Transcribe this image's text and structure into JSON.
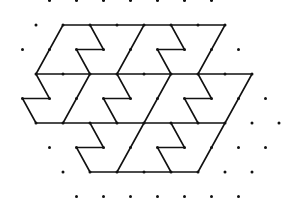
{
  "figure": {
    "line_color": "#111111",
    "dot_color": "#111111",
    "background": "#ffffff",
    "dot_radius": 1.5,
    "lattice": {
      "dx": 27,
      "dy": 24.6,
      "x0": 22.5,
      "y0": 0.5
    },
    "rows": [
      {
        "y": 0.5,
        "xs": [
          49.5,
          76.5,
          103.5,
          130.5,
          157.5,
          184.5,
          211.5
        ]
      },
      {
        "y": 25,
        "xs": [
          36,
          63,
          90,
          117,
          144,
          171,
          198,
          225
        ]
      },
      {
        "y": 49.5,
        "xs": [
          22.5,
          49.5,
          76.5,
          103.5,
          130.5,
          157.5,
          184.5,
          211.5,
          238.5
        ]
      },
      {
        "y": 74,
        "xs": [
          36,
          63,
          90,
          117,
          144,
          171,
          198,
          225,
          252
        ]
      },
      {
        "y": 98.5,
        "xs": [
          22.5,
          49.5,
          76.5,
          103.5,
          130.5,
          157.5,
          184.5,
          211.5,
          238.5,
          265.5
        ]
      },
      {
        "y": 123,
        "xs": [
          36,
          63,
          90,
          117,
          144,
          171,
          198,
          225,
          252,
          279
        ]
      },
      {
        "y": 147.5,
        "xs": [
          49.5,
          76.5,
          103.5,
          130.5,
          157.5,
          184.5,
          211.5,
          238.5,
          265.5
        ]
      },
      {
        "y": 172,
        "xs": [
          63,
          90,
          117,
          144,
          171,
          198,
          225,
          252
        ]
      },
      {
        "y": 196.5,
        "xs": [
          76.5,
          103.5,
          130.5,
          157.5,
          184.5,
          211.5,
          238.5
        ]
      }
    ],
    "polylines": [
      [
        [
          63,
          25
        ],
        [
          225,
          25
        ]
      ],
      [
        [
          63,
          25
        ],
        [
          36,
          74
        ]
      ],
      [
        [
          90,
          25
        ],
        [
          103.5,
          49.5
        ],
        [
          76.5,
          49.5
        ],
        [
          90,
          74
        ]
      ],
      [
        [
          144,
          25
        ],
        [
          117,
          74
        ]
      ],
      [
        [
          171,
          25
        ],
        [
          184.5,
          49.5
        ],
        [
          157.5,
          49.5
        ],
        [
          171,
          74
        ]
      ],
      [
        [
          225,
          25
        ],
        [
          198,
          74
        ]
      ],
      [
        [
          36,
          74
        ],
        [
          252,
          74
        ]
      ],
      [
        [
          36,
          74
        ],
        [
          49.5,
          98.5
        ],
        [
          22.5,
          98.5
        ],
        [
          36,
          123
        ]
      ],
      [
        [
          90,
          74
        ],
        [
          63,
          123
        ]
      ],
      [
        [
          117,
          74
        ],
        [
          130.5,
          98.5
        ],
        [
          103.5,
          98.5
        ],
        [
          117,
          123
        ]
      ],
      [
        [
          171,
          74
        ],
        [
          144,
          123
        ]
      ],
      [
        [
          198,
          74
        ],
        [
          211.5,
          98.5
        ],
        [
          184.5,
          98.5
        ],
        [
          198,
          123
        ]
      ],
      [
        [
          252,
          74
        ],
        [
          225,
          123
        ]
      ],
      [
        [
          36,
          123
        ],
        [
          225,
          123
        ]
      ],
      [
        [
          90,
          123
        ],
        [
          103.5,
          147.5
        ],
        [
          76.5,
          147.5
        ],
        [
          90,
          172
        ]
      ],
      [
        [
          144,
          123
        ],
        [
          117,
          172
        ]
      ],
      [
        [
          171,
          123
        ],
        [
          184.5,
          147.5
        ],
        [
          157.5,
          147.5
        ],
        [
          171,
          172
        ]
      ],
      [
        [
          225,
          123
        ],
        [
          198,
          172
        ]
      ],
      [
        [
          90,
          172
        ],
        [
          198,
          172
        ]
      ]
    ]
  }
}
